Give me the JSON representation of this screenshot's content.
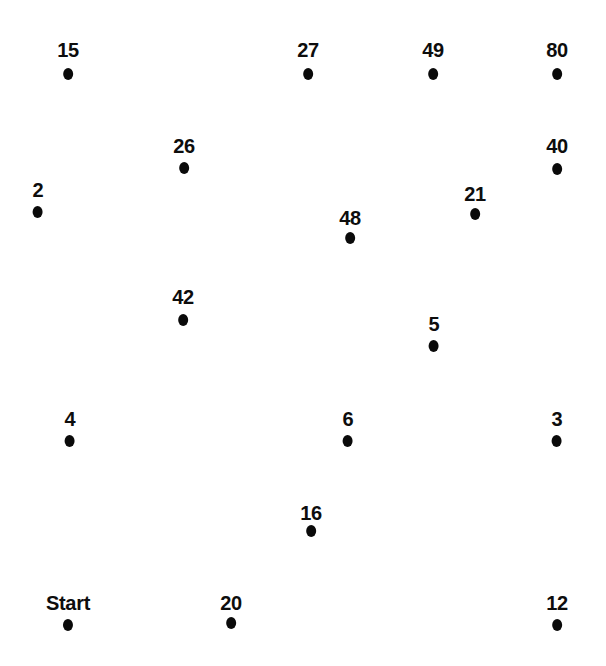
{
  "page": {
    "background_color": "#ffffff",
    "ink_color": "#0a0a0a",
    "width": 606,
    "height": 666
  },
  "puzzle": {
    "type": "connect-the-dots",
    "start_label": "Start",
    "dot_count": 18
  },
  "dots": [
    {
      "label": "15",
      "x": 68,
      "label_y": 40,
      "dot_y": 68
    },
    {
      "label": "27",
      "x": 308,
      "label_y": 40,
      "dot_y": 68
    },
    {
      "label": "49",
      "x": 433,
      "label_y": 40,
      "dot_y": 68
    },
    {
      "label": "80",
      "x": 557,
      "label_y": 40,
      "dot_y": 68
    },
    {
      "label": "26",
      "x": 184,
      "label_y": 136,
      "dot_y": 162
    },
    {
      "label": "40",
      "x": 557,
      "label_y": 136,
      "dot_y": 163
    },
    {
      "label": "2",
      "x": 38,
      "label_y": 180,
      "dot_y": 206
    },
    {
      "label": "21",
      "x": 475,
      "label_y": 184,
      "dot_y": 208
    },
    {
      "label": "48",
      "x": 350,
      "label_y": 208,
      "dot_y": 232
    },
    {
      "label": "42",
      "x": 183,
      "label_y": 287,
      "dot_y": 314
    },
    {
      "label": "5",
      "x": 434,
      "label_y": 314,
      "dot_y": 340
    },
    {
      "label": "4",
      "x": 70,
      "label_y": 409,
      "dot_y": 435
    },
    {
      "label": "6",
      "x": 348,
      "label_y": 409,
      "dot_y": 435
    },
    {
      "label": "3",
      "x": 557,
      "label_y": 409,
      "dot_y": 435
    },
    {
      "label": "16",
      "x": 311,
      "label_y": 503,
      "dot_y": 525
    },
    {
      "label": "Start",
      "x": 68,
      "label_y": 593,
      "dot_y": 619
    },
    {
      "label": "20",
      "x": 231,
      "label_y": 593,
      "dot_y": 617
    },
    {
      "label": "12",
      "x": 557,
      "label_y": 593,
      "dot_y": 619
    }
  ]
}
